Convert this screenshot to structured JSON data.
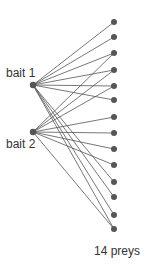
{
  "diagram": {
    "baits": [
      {
        "label": "bait 1",
        "x": 33,
        "y": 85,
        "label_x": 6,
        "label_y": 66
      },
      {
        "label": "bait 2",
        "x": 33,
        "y": 132,
        "label_x": 6,
        "label_y": 137
      }
    ],
    "preys": {
      "x": 114,
      "ys": [
        22,
        37,
        53,
        70,
        86,
        100,
        117,
        133,
        149,
        165,
        182,
        197,
        215,
        229
      ],
      "caption": "14 preys"
    },
    "edges": {
      "bait1": [
        0,
        1,
        2,
        3,
        4,
        5,
        10,
        11,
        12,
        13
      ],
      "bait2": [
        2,
        3,
        4,
        6,
        7,
        8,
        9,
        13
      ]
    },
    "colors": {
      "node": "#555555",
      "edge": "#555555",
      "text": "#333333"
    }
  }
}
